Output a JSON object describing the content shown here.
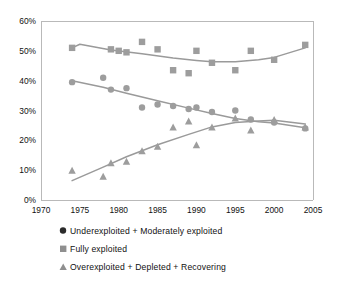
{
  "chart_data": {
    "type": "scatter",
    "title": "",
    "subtitle": "",
    "xlabel": "",
    "ylabel": "",
    "xlim": [
      1970,
      2005
    ],
    "ylim": [
      0,
      60
    ],
    "grid": false,
    "legend_position": "bottom-left",
    "x_tick_labels": [
      "1970",
      "1975",
      "1980",
      "1985",
      "1990",
      "1995",
      "2000",
      "2005"
    ],
    "x_ticks": [
      1970,
      1975,
      1980,
      1985,
      1990,
      1995,
      2000,
      2005
    ],
    "y_tick_labels": [
      "0%",
      "10%",
      "20%",
      "30%",
      "40%",
      "50%",
      "60%"
    ],
    "y_ticks": [
      0,
      10,
      20,
      30,
      40,
      50,
      60
    ],
    "y_unit": "%",
    "series": [
      {
        "name": "Underexploited + Moderately exploited",
        "marker": "circle",
        "color": "#9d9d9d",
        "points": [
          {
            "x": 1974,
            "y": 39.5
          },
          {
            "x": 1978,
            "y": 41.0
          },
          {
            "x": 1979,
            "y": 37.0
          },
          {
            "x": 1981,
            "y": 37.5
          },
          {
            "x": 1983,
            "y": 31.0
          },
          {
            "x": 1985,
            "y": 32.0
          },
          {
            "x": 1987,
            "y": 31.5
          },
          {
            "x": 1989,
            "y": 30.5
          },
          {
            "x": 1990,
            "y": 31.0
          },
          {
            "x": 1992,
            "y": 29.5
          },
          {
            "x": 1995,
            "y": 30.0
          },
          {
            "x": 1997,
            "y": 27.0
          },
          {
            "x": 2000,
            "y": 26.0
          },
          {
            "x": 2004,
            "y": 24.0
          }
        ],
        "trend": [
          {
            "x": 1974,
            "y": 40.0
          },
          {
            "x": 1978,
            "y": 37.8
          },
          {
            "x": 1981,
            "y": 35.8
          },
          {
            "x": 1985,
            "y": 33.3
          },
          {
            "x": 1989,
            "y": 30.8
          },
          {
            "x": 1992,
            "y": 29.0
          },
          {
            "x": 1995,
            "y": 27.3
          },
          {
            "x": 1998,
            "y": 26.2
          },
          {
            "x": 2000,
            "y": 25.8
          },
          {
            "x": 2004,
            "y": 24.2
          }
        ]
      },
      {
        "name": "Fully exploited",
        "marker": "square",
        "color": "#9d9d9d",
        "points": [
          {
            "x": 1974,
            "y": 51.0
          },
          {
            "x": 1979,
            "y": 50.5
          },
          {
            "x": 1980,
            "y": 50.0
          },
          {
            "x": 1981,
            "y": 49.5
          },
          {
            "x": 1983,
            "y": 53.0
          },
          {
            "x": 1985,
            "y": 50.5
          },
          {
            "x": 1987,
            "y": 43.5
          },
          {
            "x": 1989,
            "y": 42.5
          },
          {
            "x": 1990,
            "y": 50.0
          },
          {
            "x": 1992,
            "y": 46.0
          },
          {
            "x": 1995,
            "y": 43.5
          },
          {
            "x": 1997,
            "y": 50.0
          },
          {
            "x": 2000,
            "y": 47.0
          },
          {
            "x": 2004,
            "y": 52.0
          }
        ],
        "trend": [
          {
            "x": 1974,
            "y": 51.0
          },
          {
            "x": 1975,
            "y": 52.2
          },
          {
            "x": 1979,
            "y": 50.3
          },
          {
            "x": 1983,
            "y": 49.0
          },
          {
            "x": 1987,
            "y": 47.6
          },
          {
            "x": 1990,
            "y": 46.8
          },
          {
            "x": 1992,
            "y": 46.3
          },
          {
            "x": 1995,
            "y": 46.3
          },
          {
            "x": 1998,
            "y": 47.0
          },
          {
            "x": 2000,
            "y": 47.8
          },
          {
            "x": 2004,
            "y": 51.0
          }
        ]
      },
      {
        "name": "Overexploited + Depleted + Recovering",
        "marker": "triangle",
        "color": "#9d9d9d",
        "points": [
          {
            "x": 1974,
            "y": 10.0
          },
          {
            "x": 1978,
            "y": 8.0
          },
          {
            "x": 1979,
            "y": 12.5
          },
          {
            "x": 1981,
            "y": 13.0
          },
          {
            "x": 1983,
            "y": 16.5
          },
          {
            "x": 1985,
            "y": 18.0
          },
          {
            "x": 1987,
            "y": 24.5
          },
          {
            "x": 1989,
            "y": 26.5
          },
          {
            "x": 1990,
            "y": 18.5
          },
          {
            "x": 1992,
            "y": 24.5
          },
          {
            "x": 1995,
            "y": 27.5
          },
          {
            "x": 1997,
            "y": 23.5
          },
          {
            "x": 2000,
            "y": 27.0
          },
          {
            "x": 2004,
            "y": 24.5
          }
        ],
        "trend": [
          {
            "x": 1974,
            "y": 6.5
          },
          {
            "x": 1978,
            "y": 11.0
          },
          {
            "x": 1981,
            "y": 14.5
          },
          {
            "x": 1985,
            "y": 18.5
          },
          {
            "x": 1989,
            "y": 22.0
          },
          {
            "x": 1992,
            "y": 24.5
          },
          {
            "x": 1995,
            "y": 26.0
          },
          {
            "x": 1998,
            "y": 26.5
          },
          {
            "x": 2000,
            "y": 26.7
          },
          {
            "x": 2004,
            "y": 25.5
          }
        ]
      }
    ]
  },
  "legend": {
    "items": [
      {
        "marker": "circle",
        "label": "Underexploited + Moderately exploited"
      },
      {
        "marker": "square",
        "label": "Fully exploited"
      },
      {
        "marker": "triangle",
        "label": "Overexploited + Depleted + Recovering"
      }
    ]
  },
  "colors": {
    "marker": "#9d9d9d",
    "trend_line": "#9a9a9a",
    "axis": "#b9b9b9",
    "text": "#111111",
    "background": "#ffffff"
  }
}
